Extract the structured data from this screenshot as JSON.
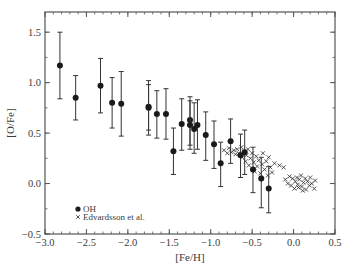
{
  "chart_data": {
    "type": "scatter",
    "title": "",
    "xlabel": "[Fe/H]",
    "ylabel": "[O/Fe]",
    "xlim": [
      -3.0,
      0.5
    ],
    "ylim": [
      -0.5,
      1.7
    ],
    "xticks": [
      -3.0,
      -2.5,
      -2.0,
      -1.5,
      -1.0,
      -0.5,
      0.0,
      0.5
    ],
    "xtick_labels": [
      "−3.0",
      "−2.5",
      "−2.0",
      "−1.5",
      "−1.0",
      "−0.5",
      "0.0",
      "0.5"
    ],
    "xminor_step": 0.1,
    "yticks": [
      -0.5,
      0.0,
      0.5,
      1.0,
      1.5
    ],
    "ytick_labels": [
      "−0.5",
      "0.0",
      "0.5",
      "1.0",
      "1.5"
    ],
    "yminor_step": 0.25,
    "grid": false,
    "legend_position": "lower left",
    "legend": [
      {
        "label": "OH",
        "marker": "filled-circle"
      },
      {
        "label": "Edvardsson et al.",
        "marker": "cross"
      }
    ],
    "series": [
      {
        "name": "OH",
        "marker": "filled-circle",
        "color": "#1a1a1a",
        "points": [
          {
            "x": -2.82,
            "y": 1.17,
            "ymax": 1.5,
            "ymin": 0.84
          },
          {
            "x": -2.63,
            "y": 0.85,
            "ymax": 1.07,
            "ymin": 0.63
          },
          {
            "x": -2.33,
            "y": 0.97,
            "ymax": 1.24,
            "ymin": 0.7
          },
          {
            "x": -2.19,
            "y": 0.8,
            "ymax": 1.05,
            "ymin": 0.55
          },
          {
            "x": -2.08,
            "y": 0.79,
            "ymax": 1.11,
            "ymin": 0.47
          },
          {
            "x": -1.75,
            "y": 0.76,
            "ymax": 1.02,
            "ymin": 0.48
          },
          {
            "x": -1.75,
            "y": 0.75,
            "ymax": 0.98,
            "ymin": 0.53
          },
          {
            "x": -1.65,
            "y": 0.69,
            "ymax": 0.92,
            "ymin": 0.45
          },
          {
            "x": -1.54,
            "y": 0.69,
            "ymax": 0.94,
            "ymin": 0.44
          },
          {
            "x": -1.45,
            "y": 0.32,
            "ymax": 0.55,
            "ymin": 0.09
          },
          {
            "x": -1.35,
            "y": 0.59,
            "ymax": 0.84,
            "ymin": 0.33
          },
          {
            "x": -1.25,
            "y": 0.63,
            "ymax": 0.86,
            "ymin": 0.38
          },
          {
            "x": -1.25,
            "y": 0.58,
            "ymax": 0.82,
            "ymin": 0.34
          },
          {
            "x": -1.2,
            "y": 0.54,
            "ymax": 0.8,
            "ymin": 0.3
          },
          {
            "x": -1.16,
            "y": 0.58,
            "ymax": 0.83,
            "ymin": 0.34
          },
          {
            "x": -1.06,
            "y": 0.48,
            "ymax": 0.71,
            "ymin": 0.23
          },
          {
            "x": -0.96,
            "y": 0.39,
            "ymax": 0.62,
            "ymin": 0.15
          },
          {
            "x": -0.88,
            "y": 0.2,
            "ymax": 0.41,
            "ymin": -0.03
          },
          {
            "x": -0.76,
            "y": 0.42,
            "ymax": 0.64,
            "ymin": 0.2
          },
          {
            "x": -0.64,
            "y": 0.28,
            "ymax": 0.49,
            "ymin": 0.06
          },
          {
            "x": -0.59,
            "y": 0.31,
            "ymax": 0.53,
            "ymin": 0.09
          },
          {
            "x": -0.49,
            "y": 0.14,
            "ymax": 0.36,
            "ymin": -0.09
          },
          {
            "x": -0.39,
            "y": 0.05,
            "ymax": 0.26,
            "ymin": -0.24
          },
          {
            "x": -0.3,
            "y": -0.05,
            "ymax": 0.17,
            "ymin": -0.29
          }
        ]
      },
      {
        "name": "Edvardsson et al.",
        "marker": "cross",
        "color": "#2a2a2a",
        "points": [
          {
            "x": -0.84,
            "y": 0.33
          },
          {
            "x": -0.8,
            "y": 0.3
          },
          {
            "x": -0.78,
            "y": 0.35
          },
          {
            "x": -0.75,
            "y": 0.31
          },
          {
            "x": -0.72,
            "y": 0.33
          },
          {
            "x": -0.7,
            "y": 0.29
          },
          {
            "x": -0.68,
            "y": 0.34
          },
          {
            "x": -0.66,
            "y": 0.3
          },
          {
            "x": -0.63,
            "y": 0.36
          },
          {
            "x": -0.62,
            "y": 0.26
          },
          {
            "x": -0.6,
            "y": 0.32
          },
          {
            "x": -0.58,
            "y": 0.22
          },
          {
            "x": -0.57,
            "y": 0.28
          },
          {
            "x": -0.55,
            "y": 0.34
          },
          {
            "x": -0.54,
            "y": 0.18
          },
          {
            "x": -0.52,
            "y": 0.25
          },
          {
            "x": -0.5,
            "y": 0.3
          },
          {
            "x": -0.48,
            "y": 0.21
          },
          {
            "x": -0.47,
            "y": 0.12
          },
          {
            "x": -0.45,
            "y": 0.27
          },
          {
            "x": -0.44,
            "y": 0.17
          },
          {
            "x": -0.42,
            "y": 0.23
          },
          {
            "x": -0.4,
            "y": 0.1
          },
          {
            "x": -0.38,
            "y": 0.19
          },
          {
            "x": -0.37,
            "y": 0.3
          },
          {
            "x": -0.35,
            "y": 0.14
          },
          {
            "x": -0.33,
            "y": 0.22
          },
          {
            "x": -0.31,
            "y": 0.08
          },
          {
            "x": -0.3,
            "y": 0.26
          },
          {
            "x": -0.28,
            "y": 0.16
          },
          {
            "x": -0.26,
            "y": 0.11
          },
          {
            "x": -0.23,
            "y": 0.2
          },
          {
            "x": -0.17,
            "y": 0.18
          },
          {
            "x": -0.12,
            "y": 0.16
          },
          {
            "x": -0.1,
            "y": 0.04
          },
          {
            "x": -0.07,
            "y": 0.0
          },
          {
            "x": -0.05,
            "y": 0.07
          },
          {
            "x": -0.03,
            "y": -0.02
          },
          {
            "x": -0.01,
            "y": 0.05
          },
          {
            "x": 0.01,
            "y": -0.05
          },
          {
            "x": 0.02,
            "y": 0.02
          },
          {
            "x": 0.04,
            "y": 0.06
          },
          {
            "x": 0.05,
            "y": -0.01
          },
          {
            "x": 0.07,
            "y": 0.04
          },
          {
            "x": 0.09,
            "y": 0.08
          },
          {
            "x": 0.1,
            "y": -0.03
          },
          {
            "x": 0.12,
            "y": 0.01
          },
          {
            "x": 0.14,
            "y": 0.05
          },
          {
            "x": 0.15,
            "y": -0.06
          },
          {
            "x": 0.17,
            "y": 0.02
          },
          {
            "x": 0.19,
            "y": -0.02
          },
          {
            "x": 0.2,
            "y": 0.06
          },
          {
            "x": 0.22,
            "y": 0.0
          },
          {
            "x": 0.25,
            "y": -0.05
          },
          {
            "x": 0.26,
            "y": 0.03
          },
          {
            "x": 0.11,
            "y": -0.07
          },
          {
            "x": 0.06,
            "y": -0.04
          }
        ]
      }
    ]
  }
}
